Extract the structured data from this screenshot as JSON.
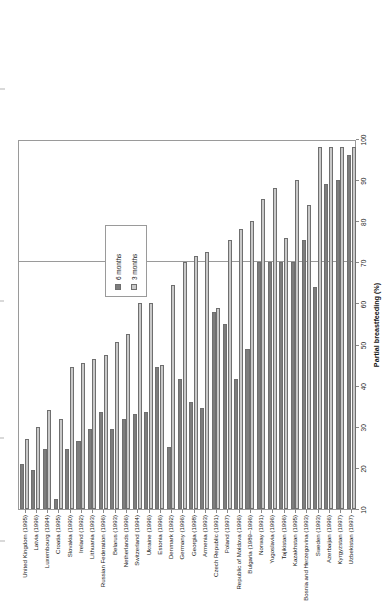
{
  "chart_data": {
    "type": "bar",
    "title": "",
    "subtitle": "",
    "orientation": "horizontal-rotated",
    "xlabel": "",
    "ylabel": "Partial breastfeeding (%)",
    "ylim": [
      10,
      100
    ],
    "yticks": [
      10,
      20,
      30,
      40,
      50,
      60,
      70,
      80,
      90,
      100
    ],
    "gridlines": [
      70
    ],
    "grid": true,
    "legend_position": "inside-upper-left",
    "categories": [
      "United Kingdom (1995)",
      "Latvia (1996)",
      "Luxembourg (1994)",
      "Croatia (1995)",
      "Slovakia (1990)",
      "Ireland (1992)",
      "Lithuania (1993)",
      "Russian Federation (1996)",
      "Belarus (1993)",
      "Netherlands (1996)",
      "Switzerland (1994)",
      "Ukraine (1996)",
      "Estonia (1996)",
      "Denmark (1992)",
      "Germany (1996)",
      "Georgia (1998)",
      "Armenia (1993)",
      "Czech Republic (1991)",
      "Poland (1997)",
      "Republic of Moldova (1996)",
      "Bulgaria (1989–1996)",
      "Norway (1991)",
      "Yugoslavia (1996)",
      "Tajikistan (1996)",
      "Kazakhstan (1995)",
      "Bosnia and Herzegovina (1993)",
      "Sweden (1993)",
      "Azerbaijan (1996)",
      "Kyrgyzstan (1997)",
      "Uzbekistan (1997)"
    ],
    "series": [
      {
        "name": "6 months",
        "color": "#7d7d7d",
        "values": [
          21,
          19.5,
          24.5,
          12.5,
          24.5,
          26.5,
          29.5,
          33.5,
          29.5,
          32,
          33,
          33.5,
          44.5,
          25,
          41.5,
          36,
          34.5,
          58,
          55,
          41.5,
          49,
          70,
          70,
          70,
          70,
          75.5,
          64,
          89,
          90,
          96
        ]
      },
      {
        "name": "3 months",
        "color": "#c9c9c9",
        "values": [
          27,
          30,
          34,
          32,
          44.5,
          45.5,
          46.5,
          47.5,
          50.5,
          52.5,
          60,
          60,
          45,
          64.5,
          70,
          71.5,
          72.5,
          59,
          75.5,
          78,
          80,
          85.5,
          88,
          76,
          90,
          84,
          98,
          98,
          98,
          98
        ]
      }
    ]
  },
  "axis": {
    "value_axis_title": "Partial breastfeeding (%)",
    "value_axis_ticks": [
      "10",
      "20",
      "30",
      "40",
      "50",
      "60",
      "70",
      "80",
      "90",
      "100"
    ]
  },
  "legend": {
    "items": [
      {
        "label": "6 months",
        "color": "#7d7d7d",
        "swatch": "dark-gray-square"
      },
      {
        "label": "3 months",
        "color": "#c9c9c9",
        "swatch": "light-gray-square"
      }
    ]
  }
}
